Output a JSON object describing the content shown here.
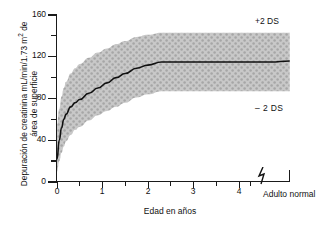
{
  "figure": {
    "background": "#ffffff",
    "band_fill": "#c8c8c8",
    "band_dot": "#a6a6a6",
    "line_color": "#111111"
  },
  "axes": {
    "y_title_line1": "Depuración de creatinina mL/min/1.73 m",
    "y_title_sup": "2",
    "y_title_line1_tail": " de",
    "y_title_line2": "área de superficie",
    "x_title": "Edad en años",
    "y_ticks": [
      "0",
      "40",
      "80",
      "120",
      "160"
    ],
    "y_minor_ticks": [
      "20",
      "60",
      "100",
      "140"
    ],
    "x_ticks": [
      "0",
      "1",
      "2",
      "3",
      "4"
    ],
    "x_minor_ticks": [
      "0.5",
      "1.5",
      "2.5",
      "3.5",
      "4.5"
    ],
    "x_break_label": "Adulto normal"
  },
  "annotations": {
    "upper": "+2 DS",
    "lower": "– 2 DS"
  },
  "chart_data": {
    "type": "line",
    "title": "",
    "xlabel": "Edad en años",
    "ylabel": "Depuración de creatinina mL/min/1.73 m2 de área de superficie",
    "xlim": [
      0,
      5.1
    ],
    "ylim": [
      0,
      160
    ],
    "grid": false,
    "legend": "none",
    "x_axis_break_at": 4.72,
    "x_adult_tick": 5.12,
    "series": [
      {
        "name": "Media",
        "x": [
          0.0,
          0.05,
          0.1,
          0.15,
          0.2,
          0.3,
          0.4,
          0.5,
          0.7,
          0.9,
          1.1,
          1.3,
          1.5,
          1.75,
          2.0,
          2.3,
          3.0,
          4.0,
          4.7,
          5.12
        ],
        "values": [
          22,
          40,
          52,
          60,
          65,
          72,
          76,
          79,
          85,
          90,
          95,
          100,
          104,
          109,
          112,
          115,
          115,
          115,
          115,
          116
        ]
      },
      {
        "name": "+2 DS",
        "x": [
          0.0,
          0.05,
          0.1,
          0.15,
          0.2,
          0.3,
          0.4,
          0.5,
          0.7,
          0.9,
          1.1,
          1.3,
          1.5,
          1.75,
          2.0,
          2.3,
          3.0,
          4.0,
          4.7,
          5.12
        ],
        "values": [
          55,
          70,
          82,
          90,
          96,
          104,
          109,
          113,
          119,
          124,
          128,
          132,
          135,
          139,
          141,
          143,
          143,
          143,
          143,
          143
        ]
      },
      {
        "name": "-2 DS",
        "x": [
          0.0,
          0.05,
          0.1,
          0.15,
          0.2,
          0.3,
          0.4,
          0.5,
          0.7,
          0.9,
          1.1,
          1.3,
          1.5,
          1.75,
          2.0,
          2.3,
          3.0,
          4.0,
          4.7,
          5.12
        ],
        "values": [
          10,
          20,
          28,
          34,
          39,
          45,
          50,
          53,
          59,
          64,
          68,
          72,
          76,
          81,
          84,
          87,
          87,
          87,
          87,
          87
        ]
      }
    ]
  }
}
